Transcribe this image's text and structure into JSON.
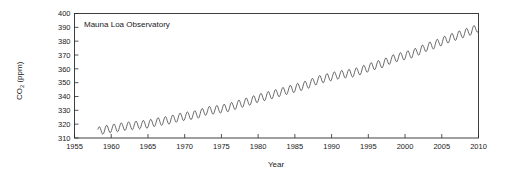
{
  "chart_data": {
    "type": "line",
    "title": "",
    "annotation": "Mauna Loa Observatory",
    "xlabel": "Year",
    "ylabel": "CO2 (ppm)",
    "ylabel_parts": {
      "base": "CO",
      "sub": "2",
      "unit": " (ppm)"
    },
    "xlim": [
      1955,
      2010
    ],
    "ylim": [
      310,
      400
    ],
    "xticks": [
      1955,
      1960,
      1965,
      1970,
      1975,
      1980,
      1985,
      1990,
      1995,
      2000,
      2005,
      2010
    ],
    "yticks": [
      310,
      320,
      330,
      340,
      350,
      360,
      370,
      380,
      390,
      400
    ],
    "grid": false,
    "legend": "none",
    "line_color": "#3a3a3a",
    "axis_color": "#2b2b2b",
    "background": "#ffffff",
    "series": [
      {
        "name": "Atmospheric CO2 concentration (monthly mean)",
        "description": "Keeling Curve: rising annual trend with seasonal sawtooth oscillation of about 6 ppm peak-to-trough, maxima in May and minima in September.",
        "seasonal_amplitude_ppm": 6.0,
        "x": [
          1958.2,
          1959,
          1960,
          1961,
          1962,
          1963,
          1964,
          1965,
          1966,
          1967,
          1968,
          1969,
          1970,
          1971,
          1972,
          1973,
          1974,
          1975,
          1976,
          1977,
          1978,
          1979,
          1980,
          1981,
          1982,
          1983,
          1984,
          1985,
          1986,
          1987,
          1988,
          1989,
          1990,
          1991,
          1992,
          1993,
          1994,
          1995,
          1996,
          1997,
          1998,
          1999,
          2000,
          2001,
          2002,
          2003,
          2004,
          2005,
          2006,
          2007,
          2008,
          2009,
          2010
        ],
        "annual_mean_values": [
          315.0,
          315.8,
          316.9,
          317.6,
          318.5,
          319.0,
          319.6,
          320.0,
          321.4,
          322.2,
          323.0,
          324.6,
          325.7,
          326.3,
          327.5,
          329.7,
          330.2,
          331.1,
          332.0,
          333.8,
          335.4,
          336.8,
          338.8,
          340.1,
          341.4,
          343.0,
          344.6,
          346.0,
          347.4,
          349.2,
          351.6,
          353.1,
          354.4,
          355.6,
          356.4,
          357.1,
          358.8,
          360.8,
          362.6,
          363.8,
          366.6,
          368.3,
          369.5,
          371.0,
          373.2,
          375.8,
          377.5,
          379.8,
          381.9,
          383.8,
          385.6,
          387.4,
          389.8
        ]
      }
    ]
  },
  "axis": {
    "x_title": "Year",
    "y_title_base": "CO",
    "y_title_sub": "2",
    "y_title_unit": " (ppm)"
  }
}
